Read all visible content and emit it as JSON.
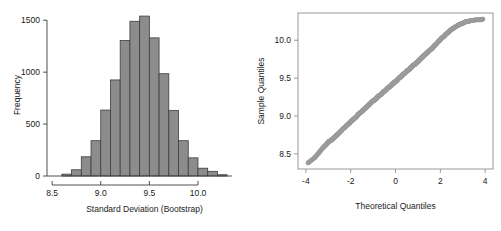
{
  "figure": {
    "background": "#ffffff",
    "panel_count": 2
  },
  "chart_data": [
    {
      "type": "bar",
      "name": "bootstrap-standard-deviation-histogram",
      "title": "",
      "xlabel": "Standard Deviation (Bootstrap)",
      "ylabel": "Frequency",
      "xlim": [
        8.55,
        10.35
      ],
      "ylim": [
        0,
        1560
      ],
      "xticks": [
        8.5,
        9.0,
        9.5,
        10.0
      ],
      "xtick_labels": [
        "8.5",
        "9.0",
        "9.5",
        "10.0"
      ],
      "yticks": [
        0,
        500,
        1000,
        1500
      ],
      "ytick_labels": [
        "0",
        "500",
        "1000",
        "1500"
      ],
      "grid": false,
      "legend": "none",
      "bin_width": 0.1,
      "bar_fill": "#8c8c8c",
      "bar_edge": "#3d3d3d",
      "bin_starts": [
        8.6,
        8.7,
        8.8,
        8.9,
        9.0,
        9.1,
        9.2,
        9.3,
        9.4,
        9.5,
        9.6,
        9.7,
        9.8,
        9.9,
        10.0,
        10.1,
        10.2
      ],
      "categories": [
        "8.6",
        "8.7",
        "8.8",
        "8.9",
        "9.0",
        "9.1",
        "9.2",
        "9.3",
        "9.4",
        "9.5",
        "9.6",
        "9.7",
        "9.8",
        "9.9",
        "10.0",
        "10.1",
        "10.2"
      ],
      "values": [
        18,
        60,
        185,
        340,
        635,
        925,
        1305,
        1490,
        1540,
        1330,
        985,
        630,
        340,
        175,
        75,
        45,
        12
      ]
    },
    {
      "type": "scatter",
      "name": "normal-qq-plot",
      "title": "",
      "xlabel": "Theoretical Quantiles",
      "ylabel": "Sample Quantiles",
      "xlim": [
        -4.35,
        4.35
      ],
      "ylim": [
        8.3,
        10.36
      ],
      "xticks": [
        -4,
        -2,
        0,
        2,
        4
      ],
      "xtick_labels": [
        "-4",
        "-2",
        "0",
        "2",
        "4"
      ],
      "yticks": [
        8.5,
        9.0,
        9.5,
        10.0
      ],
      "ytick_labels": [
        "8.5",
        "9.0",
        "9.5",
        "10.0"
      ],
      "grid": false,
      "legend": "none",
      "frame": "box",
      "point_color": "#9a9a9a",
      "point_size": 2.4,
      "x": [
        -3.9,
        -3.6,
        -3.4,
        -3.24,
        -3.1,
        -2.98,
        -2.86,
        -2.75,
        -2.64,
        -2.54,
        -2.44,
        -2.34,
        -2.25,
        -2.16,
        -2.07,
        -1.98,
        -1.9,
        -1.82,
        -1.74,
        -1.66,
        -1.58,
        -1.5,
        -1.43,
        -1.36,
        -1.28,
        -1.21,
        -1.14,
        -1.07,
        -1.0,
        -0.93,
        -0.86,
        -0.8,
        -0.73,
        -0.66,
        -0.6,
        -0.53,
        -0.47,
        -0.4,
        -0.34,
        -0.28,
        -0.21,
        -0.15,
        -0.09,
        -0.03,
        0.03,
        0.09,
        0.15,
        0.21,
        0.28,
        0.34,
        0.4,
        0.47,
        0.53,
        0.6,
        0.66,
        0.73,
        0.8,
        0.86,
        0.93,
        1.0,
        1.07,
        1.14,
        1.21,
        1.28,
        1.36,
        1.43,
        1.5,
        1.58,
        1.66,
        1.74,
        1.82,
        1.9,
        1.98,
        2.07,
        2.16,
        2.25,
        2.34,
        2.44,
        2.54,
        2.64,
        2.75,
        2.86,
        2.98,
        3.1,
        3.24,
        3.4,
        3.6,
        3.78,
        3.9
      ],
      "y": [
        8.38,
        8.45,
        8.52,
        8.58,
        8.62,
        8.66,
        8.68,
        8.71,
        8.74,
        8.77,
        8.8,
        8.83,
        8.85,
        8.88,
        8.9,
        8.93,
        8.95,
        8.97,
        8.99,
        9.02,
        9.04,
        9.06,
        9.08,
        9.1,
        9.12,
        9.14,
        9.16,
        9.18,
        9.2,
        9.21,
        9.23,
        9.25,
        9.27,
        9.28,
        9.3,
        9.32,
        9.33,
        9.35,
        9.37,
        9.38,
        9.4,
        9.42,
        9.43,
        9.45,
        9.46,
        9.48,
        9.5,
        9.51,
        9.53,
        9.55,
        9.56,
        9.58,
        9.6,
        9.61,
        9.63,
        9.65,
        9.67,
        9.68,
        9.7,
        9.72,
        9.74,
        9.76,
        9.78,
        9.8,
        9.82,
        9.84,
        9.86,
        9.88,
        9.9,
        9.93,
        9.95,
        9.98,
        10.0,
        10.03,
        10.05,
        10.08,
        10.1,
        10.13,
        10.15,
        10.17,
        10.19,
        10.21,
        10.22,
        10.24,
        10.25,
        10.26,
        10.27,
        10.27,
        10.28
      ]
    }
  ],
  "histogram_panel": {
    "xlabel": "Standard Deviation (Bootstrap)",
    "ylabel": "Frequency"
  },
  "qq_panel": {
    "xlabel": "Theoretical Quantiles",
    "ylabel": "Sample Quantiles"
  }
}
